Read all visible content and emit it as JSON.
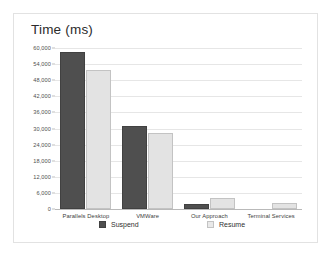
{
  "chart_data": {
    "type": "bar",
    "title": "Time (ms)",
    "xlabel": "",
    "ylabel": "",
    "ylim": [
      0,
      60000
    ],
    "ytick_step": 6000,
    "ytick_labels": [
      "60,000",
      "54,000",
      "48,000",
      "42,000",
      "36,000",
      "30,000",
      "24,000",
      "18,000",
      "12,000",
      "6,000",
      "0"
    ],
    "ytick_values": [
      60000,
      54000,
      48000,
      42000,
      36000,
      30000,
      24000,
      18000,
      12000,
      6000,
      0
    ],
    "grid": true,
    "legend_position": "bottom",
    "categories": [
      "Parallels Desktop",
      "VMWare",
      "Our Approach",
      "Terminal Services"
    ],
    "series": [
      {
        "name": "Suspend",
        "color": "#4f4f4f",
        "values": [
          58500,
          30800,
          1800,
          0
        ]
      },
      {
        "name": "Resume",
        "color": "#e3e3e3",
        "values": [
          51800,
          28300,
          4200,
          2200
        ]
      }
    ]
  },
  "legend": {
    "suspend_label": "Suspend",
    "resume_label": "Resume"
  }
}
